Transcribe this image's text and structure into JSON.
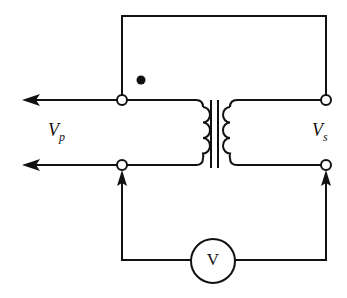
{
  "diagram": {
    "type": "transformer-polarity-test-circuit",
    "labels": {
      "primary_voltage": {
        "main": "V",
        "sub": "p"
      },
      "secondary_voltage": {
        "main": "V",
        "sub": "s"
      },
      "voltmeter": "V"
    },
    "elements": [
      "primary terminals with output arrows",
      "transformer with primary and secondary coils and iron core",
      "polarity dot",
      "jumper wire connecting top terminals",
      "voltmeter across bottom terminals"
    ],
    "colors": {
      "line": "#111111",
      "background": "#ffffff"
    }
  }
}
